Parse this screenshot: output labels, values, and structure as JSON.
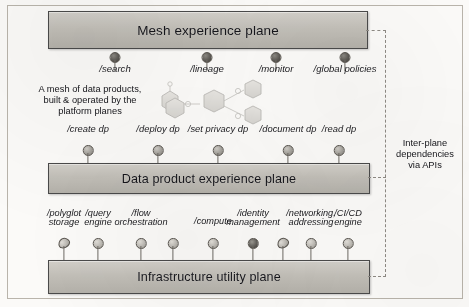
{
  "figure": {
    "frame_color": "#b9b4ab",
    "plane_fill": "#c5c2bb",
    "plane_border": "#4a4a4a"
  },
  "planes": [
    {
      "id": "mesh",
      "label": "Mesh experience plane"
    },
    {
      "id": "dp",
      "label": "Data product experience plane"
    },
    {
      "id": "infra",
      "label": "Infrastructure utility plane"
    }
  ],
  "mesh_endpoints": [
    {
      "label": "/search"
    },
    {
      "label": "/lineage"
    },
    {
      "label": "/monitor"
    },
    {
      "label": "/global policies"
    }
  ],
  "data_product_endpoints": [
    {
      "label": "/create dp"
    },
    {
      "label": "/deploy dp"
    },
    {
      "label": "/set privacy dp"
    },
    {
      "label": "/document dp"
    },
    {
      "label": "/read dp"
    }
  ],
  "infrastructure_endpoints": [
    {
      "line1": "/polyglot",
      "line2": "storage"
    },
    {
      "line1": "/query",
      "line2": "engine"
    },
    {
      "line1": "/flow",
      "line2": "orchestration"
    },
    {
      "line1": "/compute",
      "line2": ""
    },
    {
      "line1": "/identity",
      "line2": "management"
    },
    {
      "line1": "/networking,",
      "line2": "addressing"
    },
    {
      "line1": "/CI/CD",
      "line2": "engine"
    }
  ],
  "annotations": {
    "mesh_note": "A mesh of data products, built & operated by the platform planes",
    "mesh_note_lines": [
      "A mesh of data products,",
      "built & operated by the",
      "platform planes"
    ],
    "api_note": "Inter-plane dependencies via APIs",
    "api_note_lines": [
      "Inter-plane",
      "dependencies",
      "via APIs"
    ]
  },
  "artwork": {
    "mesh_graphic": "hexagon-mesh-graphic"
  }
}
